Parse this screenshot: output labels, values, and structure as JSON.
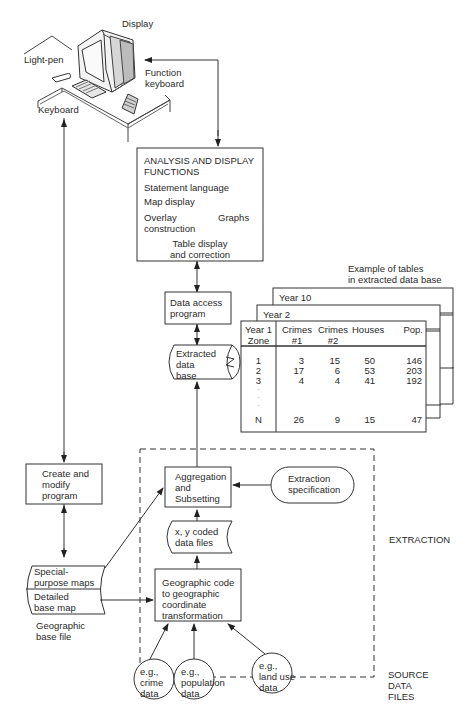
{
  "workstation": {
    "display_label": "Display",
    "lightpen_label": "Light-pen",
    "function_keyboard_label_1": "Function",
    "function_keyboard_label_2": "keyboard",
    "keyboard_label": "Keyboard"
  },
  "analysis_box": {
    "title_1": "ANALYSIS AND DISPLAY",
    "title_2": "FUNCTIONS",
    "item_statement": "Statement language",
    "item_map": "Map display",
    "item_overlay_1": "Overlay",
    "item_overlay_2": "construction",
    "item_graphs": "Graphs",
    "item_table_1": "Table display",
    "item_table_2": "and correction"
  },
  "data_access": {
    "line1": "Data access",
    "line2": "program"
  },
  "extracted_db": {
    "line1": "Extracted",
    "line2": "data",
    "line3": "base"
  },
  "tables_example": {
    "caption_1": "Example of tables",
    "caption_2": "in extracted data base",
    "year10": "Year 10",
    "year2": "Year 2",
    "header": {
      "year1": "Year 1",
      "zone": "Zone",
      "crimes1_a": "Crimes",
      "crimes1_b": "#1",
      "crimes2_a": "Crimes",
      "crimes2_b": "#2",
      "houses": "Houses",
      "pop": "Pop."
    },
    "rows": [
      {
        "zone": "1",
        "c1": "3",
        "c2": "15",
        "houses": "50",
        "pop": "146"
      },
      {
        "zone": "2",
        "c1": "17",
        "c2": "6",
        "houses": "53",
        "pop": "203"
      },
      {
        "zone": "3",
        "c1": "4",
        "c2": "4",
        "houses": "41",
        "pop": "192"
      },
      {
        "zone": "N",
        "c1": "26",
        "c2": "9",
        "houses": "15",
        "pop": "47"
      }
    ]
  },
  "create_modify": {
    "line1": "Create and",
    "line2": "modify",
    "line3": "program"
  },
  "aggregation": {
    "line1": "Aggregation",
    "line2": "and",
    "line3": "Subsetting"
  },
  "extraction_spec": {
    "line1": "Extraction",
    "line2": "specification"
  },
  "xy_files": {
    "line1": "x, y coded",
    "line2": "data files"
  },
  "geo_transform": {
    "line1": "Geographic code",
    "line2": "to geographic",
    "line3": "coordinate",
    "line4": "transformation"
  },
  "base_file": {
    "special_1": "Special-",
    "special_2": "purpose maps",
    "detailed_1": "Detailed",
    "detailed_2": "base map",
    "caption_1": "Geographic",
    "caption_2": "base file"
  },
  "sources": [
    {
      "line1": "e.g.,",
      "line2": "crime",
      "line3": "data"
    },
    {
      "line1": "e.g.,",
      "line2": "population",
      "line3": "data"
    },
    {
      "line1": "e.g.,",
      "line2": "land use",
      "line3": "data"
    }
  ],
  "labels": {
    "extraction": "EXTRACTION",
    "source_1": "SOURCE",
    "source_2": "DATA",
    "source_3": "FILES"
  }
}
